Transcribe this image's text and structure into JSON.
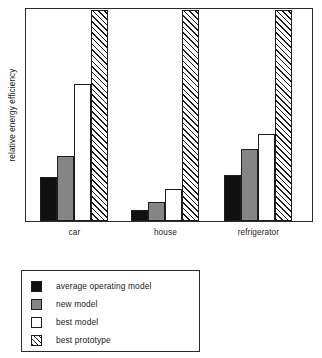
{
  "chart_data": {
    "type": "bar",
    "title": "",
    "subtitle": "",
    "xlabel": "",
    "ylabel": "relative energy efficiency",
    "categories": [
      "car",
      "house",
      "refrigerator"
    ],
    "series": [
      {
        "name": "average operating model",
        "swatch": "solid-black",
        "color": "#111111",
        "values": [
          21,
          5,
          22
        ]
      },
      {
        "name": "new model",
        "swatch": "solid-gray",
        "color": "#858585",
        "values": [
          31,
          9,
          34
        ]
      },
      {
        "name": "best model",
        "swatch": "solid-white",
        "color": "#ffffff",
        "values": [
          65,
          15,
          41
        ]
      },
      {
        "name": "best prototype",
        "swatch": "hatched",
        "color": "#ffffff",
        "values": [
          100,
          100,
          100
        ]
      }
    ],
    "ylim": [
      0,
      100
    ],
    "yticks": [],
    "ytick_labels": [],
    "grid": false,
    "legend_position": "below-plot-left",
    "axis_frame": "full-box"
  },
  "legend": {
    "entries": [
      {
        "label": "average operating model",
        "swatch": "solid-black"
      },
      {
        "label": "new model",
        "swatch": "solid-gray"
      },
      {
        "label": "best model",
        "swatch": "solid-white"
      },
      {
        "label": "best prototype",
        "swatch": "hatched"
      }
    ]
  },
  "colors": {
    "axis": "#2b2b2b",
    "outline": "#1c1c1c",
    "black_fill": "#111111",
    "gray_fill": "#858585",
    "white_fill": "#ffffff",
    "background": "#ffffff",
    "text": "#1a1a1a"
  }
}
